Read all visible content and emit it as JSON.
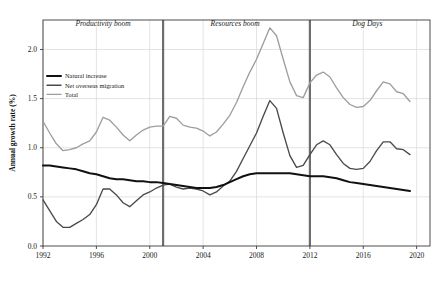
{
  "chart_data": {
    "type": "line",
    "title": "",
    "subtitle": "",
    "xlabel": "",
    "ylabel": "Annual growth rate (%)",
    "xlim": [
      1992,
      2021
    ],
    "ylim": [
      0.0,
      2.3
    ],
    "grid": true,
    "legend_position": "top-left inside plot",
    "x_ticks": [
      "1992",
      "1996",
      "2000",
      "2004",
      "2008",
      "2012",
      "2016",
      "2020"
    ],
    "x_tick_values": [
      1992,
      1996,
      2000,
      2004,
      2008,
      2012,
      2016,
      2020
    ],
    "y_ticks": [
      "0.0",
      "0.5",
      "1.0",
      "1.5",
      "2.0"
    ],
    "y_tick_values": [
      0.0,
      0.5,
      1.0,
      1.5,
      2.0
    ],
    "annotations": [
      {
        "text": "Productivity boom",
        "x": 1996.5,
        "y": 2.24,
        "style": "italic"
      },
      {
        "text": "Resources boom",
        "x": 2006.4,
        "y": 2.24,
        "style": "italic"
      },
      {
        "text": "Dog Days",
        "x": 2016.3,
        "y": 2.24,
        "style": "italic"
      }
    ],
    "vertical_dividers": [
      {
        "x": 2001.0,
        "color": "#6e6e6e"
      },
      {
        "x": 2012.0,
        "color": "#6e6e6e"
      }
    ],
    "x": [
      1992.0,
      1992.5,
      1993.0,
      1993.5,
      1994.0,
      1994.5,
      1995.0,
      1995.5,
      1996.0,
      1996.5,
      1997.0,
      1997.5,
      1998.0,
      1998.5,
      1999.0,
      1999.5,
      2000.0,
      2000.5,
      2001.0,
      2001.5,
      2002.0,
      2002.5,
      2003.0,
      2003.5,
      2004.0,
      2004.5,
      2005.0,
      2005.5,
      2006.0,
      2006.5,
      2007.0,
      2007.5,
      2008.0,
      2008.5,
      2009.0,
      2009.5,
      2010.0,
      2010.5,
      2011.0,
      2011.5,
      2012.0,
      2012.5,
      2013.0,
      2013.5,
      2014.0,
      2014.5,
      2015.0,
      2015.5,
      2016.0,
      2016.5,
      2017.0,
      2017.5,
      2018.0,
      2018.5,
      2019.0,
      2019.5
    ],
    "series": [
      {
        "name": "Natural increase",
        "color": "#111111",
        "width": 2.0,
        "values": [
          0.82,
          0.82,
          0.81,
          0.8,
          0.79,
          0.78,
          0.76,
          0.74,
          0.73,
          0.71,
          0.69,
          0.68,
          0.68,
          0.67,
          0.66,
          0.66,
          0.65,
          0.65,
          0.64,
          0.63,
          0.62,
          0.61,
          0.6,
          0.59,
          0.59,
          0.59,
          0.6,
          0.62,
          0.65,
          0.68,
          0.71,
          0.73,
          0.74,
          0.74,
          0.74,
          0.74,
          0.74,
          0.74,
          0.73,
          0.72,
          0.71,
          0.71,
          0.71,
          0.7,
          0.69,
          0.67,
          0.65,
          0.64,
          0.63,
          0.62,
          0.61,
          0.6,
          0.59,
          0.58,
          0.57,
          0.56
        ]
      },
      {
        "name": "Net overseas migration",
        "color": "#4a4a4a",
        "width": 1.35,
        "values": [
          0.47,
          0.36,
          0.25,
          0.19,
          0.19,
          0.23,
          0.27,
          0.32,
          0.42,
          0.58,
          0.58,
          0.52,
          0.44,
          0.4,
          0.46,
          0.52,
          0.55,
          0.59,
          0.62,
          0.63,
          0.6,
          0.58,
          0.59,
          0.58,
          0.56,
          0.52,
          0.55,
          0.61,
          0.66,
          0.76,
          0.89,
          1.02,
          1.15,
          1.32,
          1.48,
          1.4,
          1.15,
          0.92,
          0.8,
          0.82,
          0.93,
          1.03,
          1.07,
          1.03,
          0.93,
          0.84,
          0.79,
          0.78,
          0.79,
          0.86,
          0.97,
          1.06,
          1.06,
          0.99,
          0.98,
          0.93
        ]
      },
      {
        "name": "Total",
        "color": "#9e9e9e",
        "width": 1.35,
        "values": [
          1.27,
          1.15,
          1.04,
          0.97,
          0.98,
          1.0,
          1.04,
          1.07,
          1.16,
          1.31,
          1.28,
          1.21,
          1.13,
          1.07,
          1.13,
          1.18,
          1.21,
          1.22,
          1.22,
          1.32,
          1.3,
          1.23,
          1.21,
          1.2,
          1.17,
          1.12,
          1.16,
          1.24,
          1.33,
          1.46,
          1.62,
          1.77,
          1.9,
          2.06,
          2.22,
          2.14,
          1.9,
          1.67,
          1.53,
          1.51,
          1.66,
          1.74,
          1.77,
          1.72,
          1.61,
          1.51,
          1.44,
          1.41,
          1.42,
          1.48,
          1.58,
          1.67,
          1.65,
          1.57,
          1.55,
          1.47
        ]
      }
    ]
  },
  "legend": {
    "items": [
      {
        "label": "Natural increase",
        "color": "#111111"
      },
      {
        "label": "Net overseas migration",
        "color": "#4a4a4a"
      },
      {
        "label": "Total",
        "color": "#9e9e9e"
      }
    ]
  }
}
